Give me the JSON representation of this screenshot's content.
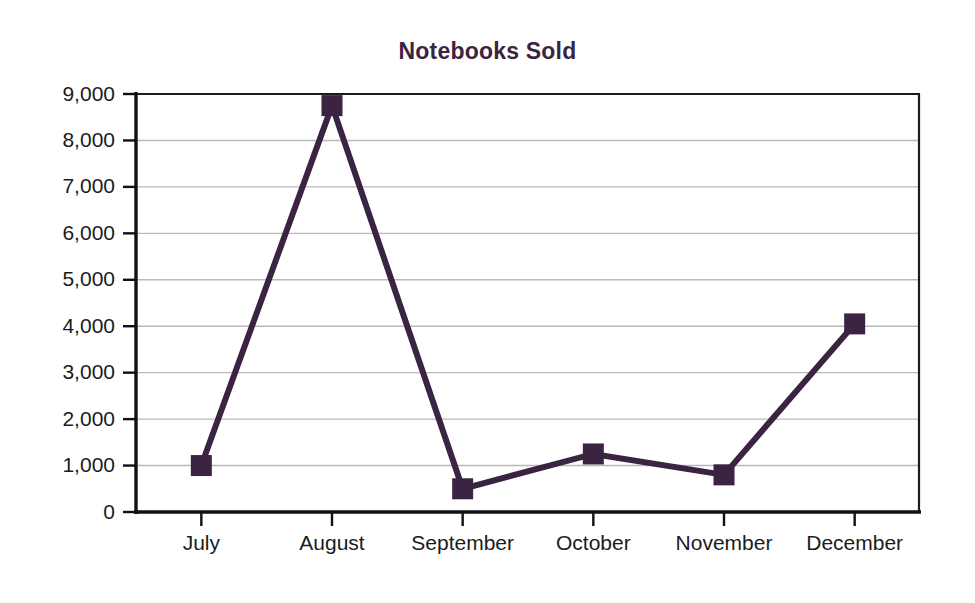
{
  "chart_data": {
    "type": "line",
    "title": "Notebooks Sold",
    "xlabel": "",
    "ylabel": "",
    "categories": [
      "July",
      "August",
      "September",
      "October",
      "November",
      "December"
    ],
    "values": [
      1000,
      8750,
      500,
      1250,
      800,
      4050
    ],
    "series": [
      {
        "name": "Notebooks Sold",
        "values": [
          1000,
          8750,
          500,
          1250,
          800,
          4050
        ]
      }
    ],
    "ylim": [
      0,
      9000
    ],
    "ytick_values": [
      0,
      1000,
      2000,
      3000,
      4000,
      5000,
      6000,
      7000,
      8000,
      9000
    ],
    "ytick_labels": [
      "0",
      "1,000",
      "2,000",
      "3,000",
      "4,000",
      "5,000",
      "6,000",
      "7,000",
      "8,000",
      "9,000"
    ],
    "grid": true,
    "legend": false,
    "legend_position": "none",
    "marker": "square",
    "colors": {
      "series": "#3b2342",
      "title": "#3b2342",
      "gridline": "#b9b9b9",
      "axis": "#111111",
      "tick_text": "#1b1b1b",
      "background": "#ffffff"
    }
  }
}
